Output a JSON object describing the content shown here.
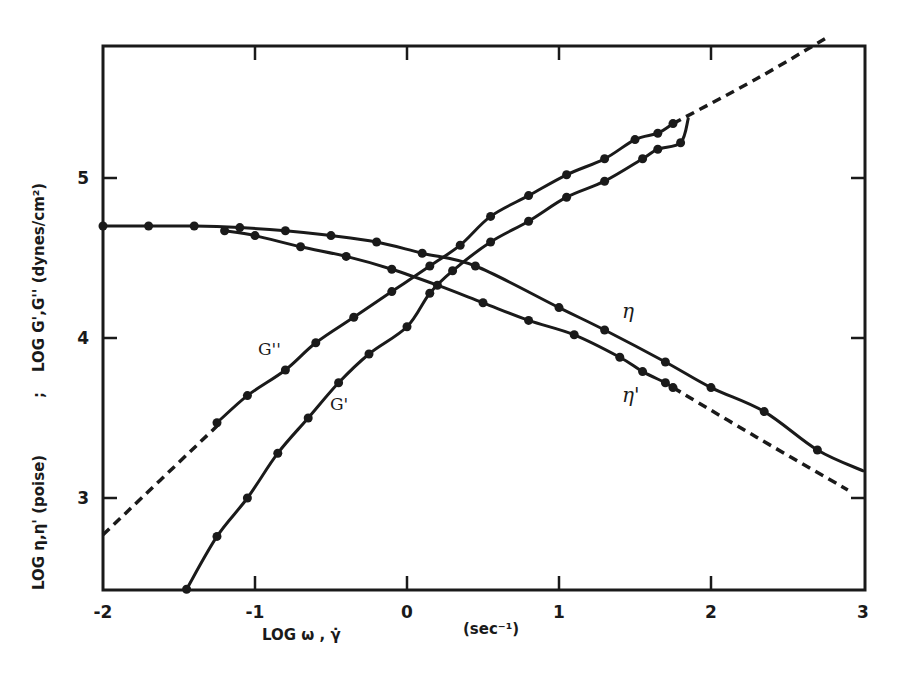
{
  "chart_data": {
    "type": "line",
    "title": "",
    "xlabel": "LOG ω , γ̇   (sec⁻¹)",
    "ylabel": "LOG η,η' (poise) ; LOG G',G'' (dynes/cm²)",
    "xlim": [
      -2,
      3
    ],
    "ylim": [
      2.4,
      5.85
    ],
    "x_ticks": [
      -2,
      -1,
      0,
      1,
      2,
      3
    ],
    "x_tick_labels": [
      "-2",
      "-1",
      "0",
      "1",
      "2",
      "3"
    ],
    "y_ticks": [
      3,
      4,
      5
    ],
    "y_tick_labels": [
      "3",
      "4",
      "5"
    ],
    "grid": false,
    "legend": "none (curves labeled inline)",
    "series": [
      {
        "name": "η",
        "label": "η",
        "style": "solid with circle markers",
        "points": [
          [
            -2.0,
            4.7
          ],
          [
            -1.7,
            4.7
          ],
          [
            -1.4,
            4.7
          ],
          [
            -1.1,
            4.69
          ],
          [
            -0.8,
            4.67
          ],
          [
            -0.5,
            4.64
          ],
          [
            -0.2,
            4.6
          ],
          [
            0.1,
            4.53
          ],
          [
            0.45,
            4.45
          ],
          [
            1.0,
            4.19
          ],
          [
            1.3,
            4.05
          ],
          [
            1.7,
            3.85
          ],
          [
            2.0,
            3.69
          ],
          [
            2.35,
            3.54
          ],
          [
            2.7,
            3.3
          ]
        ],
        "line_end": [
          3.0,
          3.17
        ],
        "label_pos": [
          1.45,
          4.15
        ]
      },
      {
        "name": "η'",
        "label": "η'",
        "style": "solid with circle markers, dashed extrapolation",
        "points": [
          [
            -1.2,
            4.67
          ],
          [
            -1.0,
            4.64
          ],
          [
            -0.7,
            4.57
          ],
          [
            -0.4,
            4.51
          ],
          [
            -0.1,
            4.43
          ],
          [
            0.2,
            4.33
          ],
          [
            0.5,
            4.22
          ],
          [
            0.8,
            4.11
          ],
          [
            1.1,
            4.02
          ],
          [
            1.4,
            3.88
          ],
          [
            1.55,
            3.79
          ],
          [
            1.7,
            3.72
          ],
          [
            1.75,
            3.69
          ]
        ],
        "dashed_extension": [
          [
            1.75,
            3.69
          ],
          [
            2.3,
            3.38
          ],
          [
            2.9,
            3.05
          ]
        ],
        "label_pos": [
          1.45,
          3.62
        ]
      },
      {
        "name": "G''",
        "label": "G''",
        "style": "solid with circle markers, dashed extrapolation both ends",
        "dashed_start": [
          [
            -2.0,
            2.77
          ],
          [
            -1.25,
            3.45
          ]
        ],
        "points": [
          [
            -1.25,
            3.47
          ],
          [
            -1.05,
            3.64
          ],
          [
            -0.8,
            3.8
          ],
          [
            -0.6,
            3.97
          ],
          [
            -0.35,
            4.13
          ],
          [
            -0.1,
            4.29
          ],
          [
            0.15,
            4.45
          ],
          [
            0.35,
            4.58
          ],
          [
            0.55,
            4.76
          ],
          [
            0.8,
            4.89
          ],
          [
            1.05,
            5.02
          ],
          [
            1.3,
            5.12
          ],
          [
            1.5,
            5.24
          ],
          [
            1.65,
            5.28
          ],
          [
            1.75,
            5.34
          ]
        ],
        "dashed_extension": [
          [
            1.75,
            5.34
          ],
          [
            2.3,
            5.62
          ],
          [
            2.75,
            5.87
          ]
        ],
        "label_pos": [
          -0.98,
          4.05
        ]
      },
      {
        "name": "G'",
        "label": "G'",
        "style": "solid with circle markers",
        "points": [
          [
            -1.45,
            2.43
          ],
          [
            -1.25,
            2.76
          ],
          [
            -1.05,
            3.0
          ],
          [
            -0.85,
            3.28
          ],
          [
            -0.65,
            3.5
          ],
          [
            -0.45,
            3.72
          ],
          [
            -0.25,
            3.9
          ],
          [
            0.0,
            4.07
          ],
          [
            0.15,
            4.28
          ],
          [
            0.3,
            4.42
          ],
          [
            0.55,
            4.6
          ],
          [
            0.8,
            4.73
          ],
          [
            1.05,
            4.88
          ],
          [
            1.3,
            4.98
          ],
          [
            1.55,
            5.12
          ],
          [
            1.65,
            5.18
          ],
          [
            1.8,
            5.22
          ]
        ],
        "line_end": [
          1.85,
          5.37
        ],
        "label_pos": [
          -0.5,
          3.58
        ]
      }
    ]
  },
  "axes": {
    "x_tick_labels": [
      "-2",
      "-1",
      "0",
      "1",
      "2",
      "3"
    ],
    "y_tick_labels": [
      "3",
      "4",
      "5"
    ],
    "x_title_main": "LOG ω , γ̇",
    "x_title_unit": "(sec⁻¹)",
    "y_title_left": "LOG η,η' (poise)",
    "y_title_sep": ";",
    "y_title_right": "LOG G',G'' (dynes/cm²)"
  },
  "labels": {
    "eta": "η",
    "eta_prime": "η'",
    "g_double_prime": "G''",
    "g_prime": "G'"
  },
  "colors": {
    "ink": "#1a1a1a",
    "background": "#ffffff"
  }
}
